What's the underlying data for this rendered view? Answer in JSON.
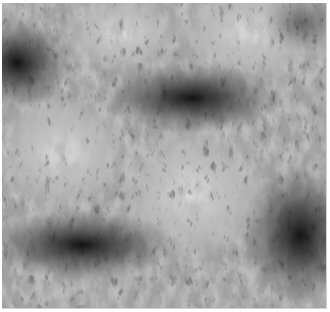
{
  "image": {
    "description": "Grayscale micrograph showing radial filamentary texture with dark convergence centers",
    "alt": "Grayscale radial filament texture",
    "dark_centers": [
      {
        "x": 15,
        "y": 60
      },
      {
        "x": 195,
        "y": 95
      },
      {
        "x": 75,
        "y": 240
      },
      {
        "x": 295,
        "y": 230
      }
    ],
    "light_regions": [
      {
        "x": 190,
        "y": 190
      },
      {
        "x": 250,
        "y": 30
      },
      {
        "x": 60,
        "y": 150
      }
    ],
    "colors": {
      "base": "#9a9a9a",
      "dark": "#1a1a1a",
      "light": "#e8e8e8"
    }
  }
}
